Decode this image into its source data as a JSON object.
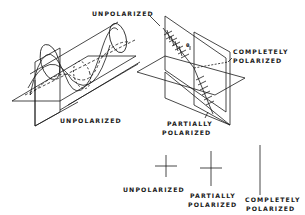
{
  "diagram": {
    "labels": {
      "top_unpolarized": "UNPOLARIZED",
      "completely_polarized_line1": "COMPLETELY",
      "completely_polarized_line2": "POLARIZED",
      "cylinder_unpolarized": "UNPOLARIZED",
      "partially_polarized_line1": "PARTIALLY",
      "partially_polarized_line2": "POLARIZED",
      "legend_unpolarized": "UNPOLARIZED",
      "legend_partially_line1": "PARTIALLY",
      "legend_partially_line2": "POLARIZED",
      "legend_completely_line1": "COMPLETELY",
      "legend_completely_line2": "POLARIZED",
      "angle_symbol": "θ"
    },
    "legend": [
      {
        "name": "unpolarized",
        "vertical_ratio": 1.0,
        "horizontal_ratio": 1.0
      },
      {
        "name": "partially-polarized",
        "vertical_ratio": 1.6,
        "horizontal_ratio": 1.0
      },
      {
        "name": "completely-polarized",
        "vertical_ratio": 1.0,
        "horizontal_ratio": 0.0
      }
    ],
    "stroke_color": "#1a1a1a"
  }
}
